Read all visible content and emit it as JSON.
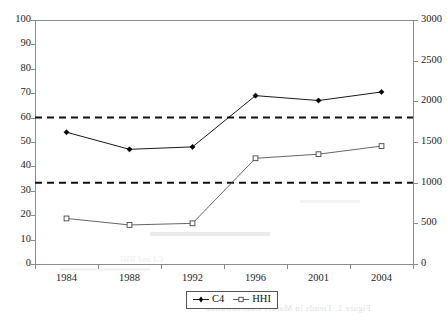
{
  "chart_data": {
    "type": "line",
    "title": "",
    "subtitle": "",
    "xlabel": "",
    "ylabel": "",
    "categories": [
      "1984",
      "1988",
      "1992",
      "1996",
      "2001",
      "2004"
    ],
    "series": [
      {
        "name": "C4",
        "axis": "left",
        "marker": "filled-diamond",
        "color": "#000000",
        "values": [
          54,
          47,
          48,
          69,
          67,
          70.5
        ]
      },
      {
        "name": "HHI",
        "axis": "right",
        "marker": "open-square",
        "color": "#555555",
        "values": [
          560,
          480,
          500,
          1300,
          1350,
          1450
        ]
      }
    ],
    "left_axis": {
      "label": "",
      "ylim": [
        0,
        100
      ],
      "step": 10,
      "ticks": [
        "0",
        "10",
        "20",
        "30",
        "40",
        "50",
        "60",
        "70",
        "80",
        "90",
        "100"
      ]
    },
    "right_axis": {
      "label": "",
      "ylim": [
        0,
        3000
      ],
      "step": 500,
      "ticks": [
        "0",
        "500",
        "1000",
        "1500",
        "2000",
        "2500",
        "3000"
      ]
    },
    "reference_lines": [
      {
        "name": "upper-threshold",
        "left_value": 60,
        "right_value": 1800,
        "style": "dashed"
      },
      {
        "name": "lower-threshold",
        "left_value": 33.3,
        "right_value": 1000,
        "style": "dashed"
      }
    ],
    "grid": false,
    "legend": {
      "position": "bottom-center",
      "entries": [
        {
          "label": "C4",
          "marker": "filled-diamond"
        },
        {
          "label": "HHI",
          "marker": "open-square"
        }
      ]
    }
  },
  "legend": {
    "items": [
      {
        "label": "C4"
      },
      {
        "label": "HHI"
      }
    ]
  },
  "artifacts": {
    "bleed_text_1": "Figure 1. Trends in Market Concentration",
    "bleed_text_2": "C4 and HHI"
  }
}
